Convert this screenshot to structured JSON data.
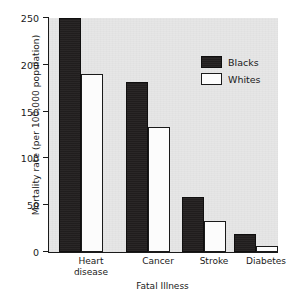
{
  "chart_data": {
    "type": "bar",
    "title": "",
    "xlabel": "Fatal Illness",
    "ylabel": "Mortality rate (per 100,000 population)",
    "categories": [
      "Heart\ndisease",
      "Cancer",
      "Stroke",
      "Diabetes"
    ],
    "series": [
      {
        "name": "Blacks",
        "values": [
          250,
          182,
          59,
          19
        ],
        "color": "#221f1f"
      },
      {
        "name": "Whites",
        "values": [
          190,
          134,
          33,
          6
        ],
        "color": "#ffffff"
      }
    ],
    "ylim": [
      0,
      250
    ],
    "yticks": [
      0,
      50,
      100,
      150,
      200,
      250
    ],
    "ytick_labels": [
      "0",
      "50",
      "100",
      "150",
      "200",
      "250"
    ],
    "grid": false,
    "legend_position": "upper right",
    "plot_background": "#e6e6e6",
    "axis_color": "#1a1a1a",
    "note_top_bar_clipped": "Blacks / Heart disease bar reaches the top of the axis at 250"
  }
}
